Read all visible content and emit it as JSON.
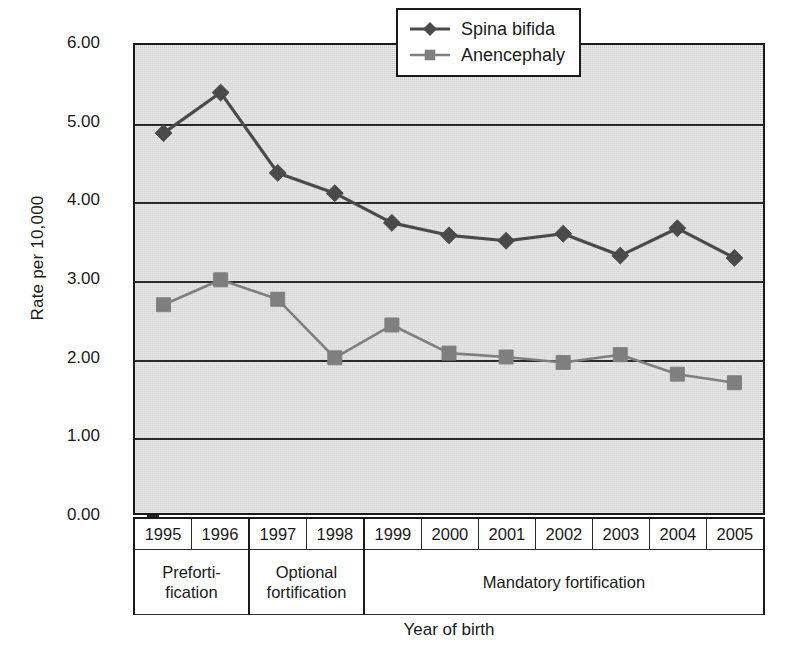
{
  "chart_data": {
    "type": "line",
    "title": "",
    "xlabel": "Year of birth",
    "ylabel": "Rate per 10,000",
    "categories": [
      "1995",
      "1996",
      "1997",
      "1998",
      "1999",
      "2000",
      "2001",
      "2002",
      "2003",
      "2004",
      "2005"
    ],
    "ylim": [
      0,
      6
    ],
    "ytick_labels": [
      "0.00",
      "1.00",
      "2.00",
      "3.00",
      "4.00",
      "5.00",
      "6.00"
    ],
    "ytick_values": [
      0,
      1,
      2,
      3,
      4,
      5,
      6
    ],
    "grid": "horizontal",
    "legend_position": "top-right",
    "series": [
      {
        "name": "Spina bifida",
        "marker": "diamond",
        "color": "#4a4a4a",
        "values": [
          4.87,
          5.39,
          4.36,
          4.1,
          3.72,
          3.56,
          3.49,
          3.58,
          3.3,
          3.65,
          3.27
        ]
      },
      {
        "name": "Anencephaly",
        "marker": "square",
        "color": "#7f7f7f",
        "values": [
          2.67,
          2.99,
          2.74,
          1.99,
          2.41,
          2.05,
          2.0,
          1.93,
          2.03,
          1.78,
          1.67
        ]
      }
    ],
    "x_groups": [
      {
        "label": "Preforti-\nfication",
        "span": 2
      },
      {
        "label": "Optional\nfortification",
        "span": 2
      },
      {
        "label": "Mandatory fortification",
        "span": 7
      }
    ]
  },
  "legend": {
    "entries": [
      {
        "label": "Spina bifida"
      },
      {
        "label": "Anencephaly"
      }
    ]
  },
  "colors": {
    "plot_background": "#d5d5d5",
    "axis": "#1a1a1a",
    "gridline": "#2a2a2a",
    "spina_bifida": "#4a4a4a",
    "anencephaly": "#7f7f7f"
  }
}
